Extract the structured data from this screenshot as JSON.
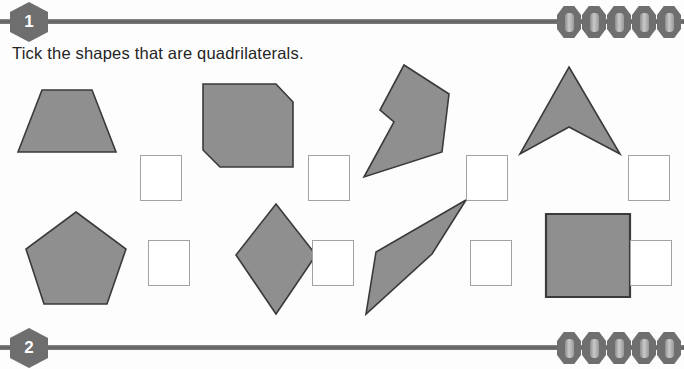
{
  "page": {
    "background_color": "#fdfdfd",
    "shape_fill": "#8f8f8f",
    "shape_stroke": "#3a3a3a",
    "rule_color": "#6a6a6a",
    "badge_color": "#6e6e6e",
    "tickbox_border": "#a2a2a2"
  },
  "header": {
    "badge_label": "1",
    "bead_count": 5
  },
  "footer": {
    "badge_label": "2",
    "bead_count": 5
  },
  "instruction": {
    "text": "Tick the shapes that are quadrilaterals."
  },
  "rows": [
    {
      "row_index": 1,
      "items": [
        {
          "shape_name": "trapezium",
          "is_quadrilateral": true,
          "sides": 4,
          "tick_checked": false,
          "points": "10,90 34,28 84,28 108,90"
        },
        {
          "shape_name": "cut-corner-hexagon",
          "is_quadrilateral": false,
          "sides": 6,
          "tick_checked": false,
          "points": "5,22 78,22 95,40 95,105 22,105 5,88"
        },
        {
          "shape_name": "concave-chevron-arrow",
          "is_quadrilateral": false,
          "sides": 6,
          "tick_checked": false,
          "points": "52,3 97,32 90,90 12,115 42,60 28,48"
        },
        {
          "shape_name": "arrowhead-dart",
          "is_quadrilateral": true,
          "sides": 4,
          "tick_checked": false,
          "points": "57,5 108,92 57,65 8,92"
        }
      ]
    },
    {
      "row_index": 2,
      "items": [
        {
          "shape_name": "regular-pentagon",
          "is_quadrilateral": false,
          "sides": 5,
          "tick_checked": false,
          "points": "58,20 108,57 89,112 26,112 8,57"
        },
        {
          "shape_name": "kite-rhombus",
          "is_quadrilateral": true,
          "sides": 4,
          "tick_checked": false,
          "points": "56,12 96,63 56,122 16,63"
        },
        {
          "shape_name": "oblique-slanted-quadrilateral",
          "is_quadrilateral": true,
          "sides": 4,
          "tick_checked": false,
          "points": "108,8 74,62 8,122 18,60"
        },
        {
          "shape_name": "square",
          "is_quadrilateral": true,
          "sides": 4,
          "tick_checked": false,
          "points": "18,22 102,22 102,105 18,105"
        }
      ]
    }
  ],
  "layout": {
    "cell_left_offsets": [
      8,
      198,
      352,
      512
    ],
    "tick_left_offsets": [
      140,
      308,
      466,
      628
    ]
  }
}
